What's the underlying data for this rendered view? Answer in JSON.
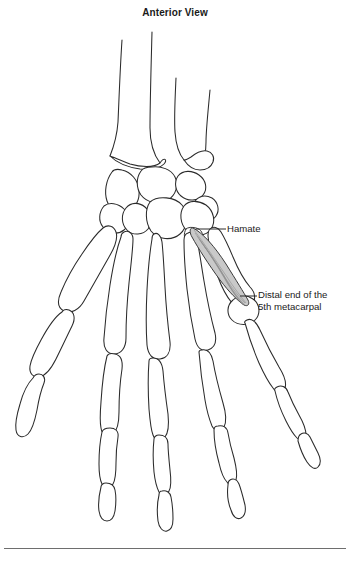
{
  "figure": {
    "title": "Anterior View",
    "background_color": "#ffffff",
    "line_color": "#2b2b2b",
    "bone_fill": "#ffffff"
  },
  "labels": [
    {
      "id": "hamate",
      "text": "Hamate",
      "target": "hamate-carpal-bone",
      "leader": "horizontal"
    },
    {
      "id": "distal-5th-metacarpal",
      "text": "Distal end of the\n5th metacarpal",
      "target": "fifth-metacarpal-head",
      "leader": "horizontal"
    }
  ],
  "muscle": {
    "name": "opponens-digiti-minimi",
    "fill_color": "#c9c9c9",
    "fiber_color": "#8e8e8e",
    "origin": "hamate",
    "insertion": "5th metacarpal"
  },
  "structures": {
    "forearm": [
      "radius",
      "ulna"
    ],
    "carpals": [
      "scaphoid",
      "lunate",
      "triquetrum",
      "pisiform",
      "trapezium",
      "trapezoid",
      "capitate",
      "hamate"
    ],
    "metacarpals": [
      "1st",
      "2nd",
      "3rd",
      "4th",
      "5th"
    ],
    "phalanges": [
      "proximal",
      "middle",
      "distal"
    ]
  }
}
